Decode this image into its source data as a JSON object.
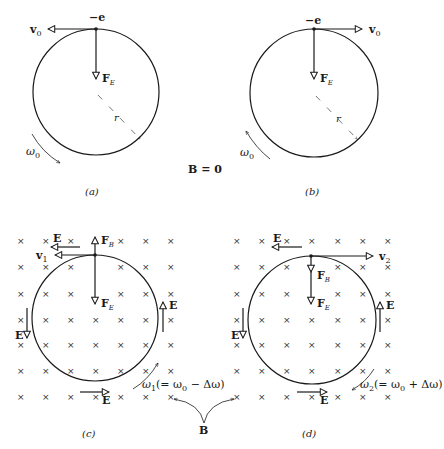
{
  "figure": {
    "panels": [
      {
        "id": "a",
        "caption": "(a)",
        "charge": "−e",
        "velocity": "v",
        "velocity_sub": "0",
        "force": "F",
        "force_sub": "E",
        "radius": "r",
        "omega": "ω",
        "omega_sub": "0"
      },
      {
        "id": "b",
        "caption": "(b)",
        "charge": "−e",
        "velocity": "v",
        "velocity_sub": "0",
        "force": "F",
        "force_sub": "E",
        "radius": "r",
        "omega": "ω",
        "omega_sub": "0"
      },
      {
        "id": "c",
        "caption": "(c)",
        "velocity": "v",
        "velocity_sub": "1",
        "force_b": "F",
        "force_b_sub": "B",
        "force_e": "F",
        "force_e_sub": "E",
        "field": "E",
        "omega": "ω",
        "omega_sub": "1",
        "omega_expr": "(= ω",
        "omega_expr_sub": "0",
        "omega_expr_tail": " − Δω)"
      },
      {
        "id": "d",
        "caption": "(d)",
        "velocity": "v",
        "velocity_sub": "2",
        "force_b": "F",
        "force_b_sub": "B",
        "force_e": "F",
        "force_e_sub": "E",
        "field": "E",
        "omega": "ω",
        "omega_sub": "2",
        "omega_expr": "(= ω",
        "omega_expr_sub": "0",
        "omega_expr_tail": " + Δω)"
      }
    ],
    "b_zero_label": "B = 0",
    "b_label": "B",
    "field_mark": "×"
  }
}
